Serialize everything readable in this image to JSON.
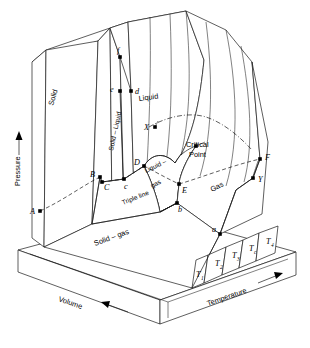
{
  "figure": {
    "type": "pvt-surface-diagram"
  },
  "axes": {
    "pressure": {
      "label": "Pressure",
      "arrow": "up-arrow-icon"
    },
    "volume": {
      "label": "Volume",
      "arrow": "left-arrow-icon"
    },
    "temperature": {
      "label": "Temperature",
      "arrow": "right-arrow-icon"
    }
  },
  "regions": [
    {
      "id": "solid",
      "label": "Solid"
    },
    {
      "id": "solid-liquid",
      "label": "Solid – Liquid"
    },
    {
      "id": "liquid",
      "label": "Liquid"
    },
    {
      "id": "liquid-gas",
      "label": "Liquid –"
    },
    {
      "id": "liquid-gas-2",
      "label": "gas"
    },
    {
      "id": "gas",
      "label": "Gas"
    },
    {
      "id": "solid-gas",
      "label": "Solid – gas"
    },
    {
      "id": "triple-line",
      "label": "Triple line"
    }
  ],
  "annotations": {
    "critical_point_line1": "Critical",
    "critical_point_line2": "Point"
  },
  "points": [
    {
      "label": "A",
      "x": 32,
      "y": 211,
      "dot_x": 40,
      "dot_y": 211
    },
    {
      "label": "B",
      "x": 93,
      "y": 174,
      "dot_x": 100,
      "dot_y": 177
    },
    {
      "label": "C",
      "x": 106,
      "y": 186,
      "dot_x": 102,
      "dot_y": 182
    },
    {
      "label": "c",
      "x": 126,
      "y": 185,
      "dot_x": 124,
      "dot_y": 179
    },
    {
      "label": "D",
      "x": 136,
      "y": 161,
      "dot_x": 144,
      "dot_y": 166
    },
    {
      "label": "E",
      "x": 185,
      "y": 190,
      "dot_x": 179,
      "dot_y": 184
    },
    {
      "label": "b",
      "x": 180,
      "y": 210,
      "dot_x": 177,
      "dot_y": 203
    },
    {
      "label": "a",
      "x": 215,
      "y": 229,
      "dot_x": 220,
      "dot_y": 234
    },
    {
      "label": "d",
      "x": 137,
      "y": 92,
      "dot_x": 131,
      "dot_y": 91
    },
    {
      "label": "e",
      "x": 113,
      "y": 89,
      "dot_x": 120,
      "dot_y": 91
    },
    {
      "label": "f",
      "x": 119,
      "y": 49,
      "dot_x": 120,
      "dot_y": 57
    },
    {
      "label": "X",
      "x": 147,
      "y": 126,
      "dot_x": 155,
      "dot_y": 127
    },
    {
      "label": "F",
      "x": 268,
      "y": 157,
      "dot_x": 260,
      "dot_y": 159
    },
    {
      "label": "Y",
      "x": 260,
      "y": 180,
      "dot_x": 253,
      "dot_y": 178
    }
  ],
  "isotherms": [
    {
      "label": "T",
      "sub": "1",
      "x": 197,
      "y": 275
    },
    {
      "label": "T",
      "sub": "2",
      "x": 218,
      "y": 260
    },
    {
      "label": "T",
      "sub": "3",
      "x": 234,
      "y": 250
    },
    {
      "label": "T",
      "sub": "c",
      "x": 252,
      "y": 243
    },
    {
      "label": "T",
      "sub": "4",
      "x": 271,
      "y": 236
    }
  ],
  "colors": {
    "stroke": "#1a1a1a",
    "background": "#ffffff",
    "point_fill": "#000000"
  }
}
